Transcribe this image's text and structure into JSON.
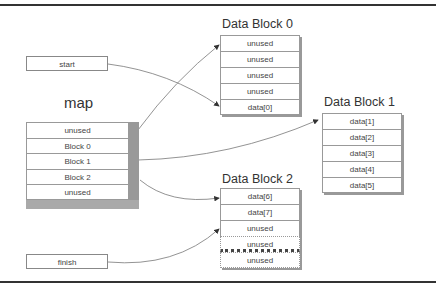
{
  "diagram": {
    "pointers": {
      "start": "start",
      "finish": "finish"
    },
    "map": {
      "title": "map",
      "cells": [
        "unused",
        "Block 0",
        "Block 1",
        "Block 2",
        "unused"
      ]
    },
    "blocks": [
      {
        "title": "Data Block 0",
        "cells": [
          "unused",
          "unused",
          "unused",
          "unused",
          "data[0]"
        ]
      },
      {
        "title": "Data Block 1",
        "cells": [
          "data[1]",
          "data[2]",
          "data[3]",
          "data[4]",
          "data[5]"
        ]
      },
      {
        "title": "Data Block 2",
        "cells": [
          "data[6]",
          "data[7]",
          "unused",
          "unused",
          "unused"
        ]
      }
    ],
    "colors": {
      "frame": "#333333",
      "shadow": "#999999",
      "arrow": "#555555"
    }
  }
}
